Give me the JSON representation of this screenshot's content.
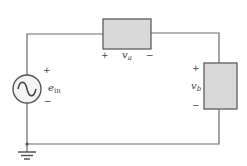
{
  "diagram": {
    "type": "series circuit",
    "source": {
      "name": "e",
      "subscript": "in",
      "plus": "+",
      "minus": "−",
      "icon": "ac-sine-source"
    },
    "element_a": {
      "name": "v",
      "subscript": "a",
      "plus": "+",
      "minus": "−"
    },
    "element_b": {
      "name": "v",
      "subscript": "b",
      "plus": "+",
      "minus": "−"
    },
    "ground": {
      "icon": "ground-symbol"
    },
    "colors": {
      "wire": "#6a6a6a",
      "box_fill": "#d9d9d9",
      "box_stroke": "#5e5e5e",
      "text": "#444444"
    }
  }
}
